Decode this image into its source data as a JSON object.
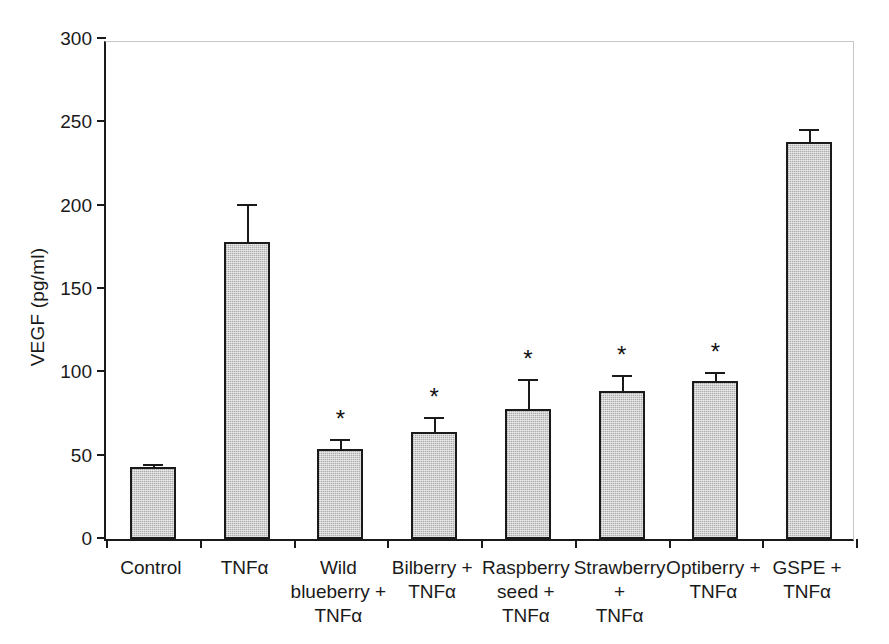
{
  "chart_data": {
    "type": "bar",
    "title": "",
    "xlabel": "",
    "ylabel": "VEGF (pg/ml)",
    "ylim": [
      0,
      300
    ],
    "ytick_values": [
      0,
      50,
      100,
      150,
      200,
      250,
      300
    ],
    "ytick_labels": [
      "0",
      "50",
      "100",
      "150",
      "200",
      "250",
      "300"
    ],
    "grid": false,
    "legend": "none",
    "categories": [
      "Control",
      "TNFα",
      "Wild blueberry + TNFα",
      "Bilberry + TNFα",
      "Raspberry seed + TNFα",
      "Strawberry + TNFα",
      "Optiberry + TNFα",
      "GSPE + TNFα"
    ],
    "category_lines": [
      [
        "Control"
      ],
      [
        "TNFα"
      ],
      [
        "Wild",
        "blueberry +",
        "TNFα"
      ],
      [
        "Bilberry +",
        "TNFα"
      ],
      [
        "Raspberry",
        "seed +",
        "TNFα"
      ],
      [
        "Strawberry +",
        "TNFα"
      ],
      [
        "Optiberry +",
        "TNFα"
      ],
      [
        "GSPE +",
        "TNFα"
      ]
    ],
    "values": [
      43,
      178,
      54,
      64,
      78,
      89,
      95,
      238
    ],
    "errors": [
      1,
      22,
      5,
      8,
      17,
      8,
      4,
      7
    ],
    "significance": [
      "",
      "",
      "*",
      "*",
      "*",
      "*",
      "*",
      ""
    ],
    "bar_color": "#bdbdbd",
    "bar_edge_color": "#1a1a1a",
    "significance_marker": "*"
  }
}
